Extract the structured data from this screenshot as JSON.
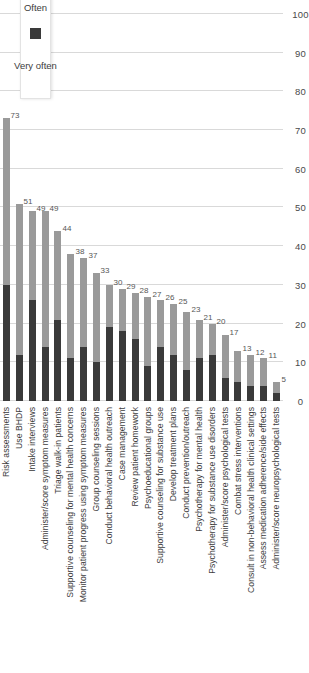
{
  "chart_data": {
    "type": "bar",
    "orientation": "vertical-rotated",
    "stacked": true,
    "title": "",
    "subtitle": "",
    "xlabel": "",
    "ylabel": "",
    "ylim": [
      0,
      100
    ],
    "grid": true,
    "legend_position": "top-left",
    "axis_ticks": [
      0,
      10,
      20,
      30,
      40,
      50,
      60,
      70,
      80,
      90,
      100
    ],
    "categories": [
      "Risk assessments",
      "Use BHDP",
      "Intake interviews",
      "Administer/score symptom measures",
      "Triage walk-in patients",
      "Supportive counseling for mental health concerns",
      "Monitor patient progress using symptom measures",
      "Group counseling sessions",
      "Conduct behavioral health outreach",
      "Case management",
      "Review patient homework",
      "Psychoeducational groups",
      "Supportive counseling for substance use",
      "Develop treatment plans",
      "Conduct prevention/outreach",
      "Psychotherapy for mental health",
      "Psychotherapy for substance use disorders",
      "Administer/score psychological tests",
      "Combat stress interventions",
      "Consult in non-behavioral health clinical settings",
      "Assess medication adherence/side effects",
      "Administer/score neuropsychological tests"
    ],
    "series": [
      {
        "name": "Very often",
        "color": "#3a3a3a",
        "values": [
          30,
          12,
          26,
          14,
          21,
          11,
          14,
          10,
          19,
          18,
          16,
          9,
          14,
          12,
          8,
          11,
          12,
          6,
          5,
          4,
          4,
          2
        ]
      },
      {
        "name": "Often",
        "color": "#9a9a9a",
        "values": [
          43,
          39,
          23,
          35,
          23,
          27,
          23,
          23,
          11,
          11,
          12,
          18,
          12,
          13,
          15,
          10,
          8,
          11,
          8,
          8,
          7,
          3
        ]
      }
    ],
    "totals": [
      73,
      51,
      49,
      49,
      44,
      38,
      37,
      33,
      30,
      29,
      28,
      27,
      26,
      25,
      23,
      21,
      20,
      17,
      13,
      12,
      11,
      5
    ],
    "value_labels": [
      "73",
      "51",
      "49",
      "49",
      "44",
      "38",
      "37",
      "33",
      "30",
      "29",
      "28",
      "27",
      "26",
      "25",
      "23",
      "21",
      "20",
      "17",
      "13",
      "12",
      "11",
      "5"
    ]
  },
  "legend": {
    "items": [
      {
        "label": "Very often",
        "color": "#3a3a3a"
      },
      {
        "label": "Often",
        "color": "#9a9a9a"
      }
    ]
  }
}
